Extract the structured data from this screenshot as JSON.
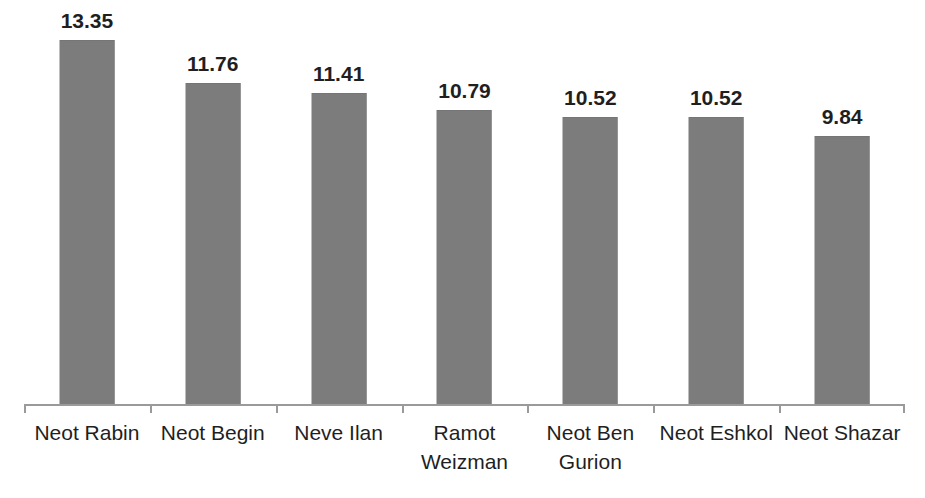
{
  "chart_data": {
    "type": "bar",
    "title": "",
    "subtitle": "",
    "xlabel": "",
    "ylabel": "",
    "ylim": [
      0,
      14.5
    ],
    "grid": false,
    "legend": false,
    "legend_position": "none",
    "axis": {
      "x_axis_visible": true,
      "y_axis_visible": false,
      "tick_marks": "between categories",
      "tick_count": 8
    },
    "bar_color": "#7c7c7c",
    "label_color": "#1f1f1f",
    "background_color": "#ffffff",
    "data_labels_shown": true,
    "categories": [
      "Neot Rabin",
      "Neot Begin",
      "Neve Ilan",
      "Ramot Weizman",
      "Neot Ben Gurion",
      "Neot Eshkol",
      "Neot Shazar"
    ],
    "category_lines": [
      [
        "Neot Rabin"
      ],
      [
        "Neot Begin"
      ],
      [
        "Neve Ilan"
      ],
      [
        "Ramot",
        "Weizman"
      ],
      [
        "Neot Ben",
        "Gurion"
      ],
      [
        "Neot Eshkol"
      ],
      [
        "Neot Shazar"
      ]
    ],
    "values": [
      13.35,
      11.76,
      11.41,
      10.79,
      10.52,
      10.52,
      9.84
    ],
    "value_labels": [
      "13.35",
      "11.76",
      "11.41",
      "10.79",
      "10.52",
      "10.52",
      "9.84"
    ]
  }
}
